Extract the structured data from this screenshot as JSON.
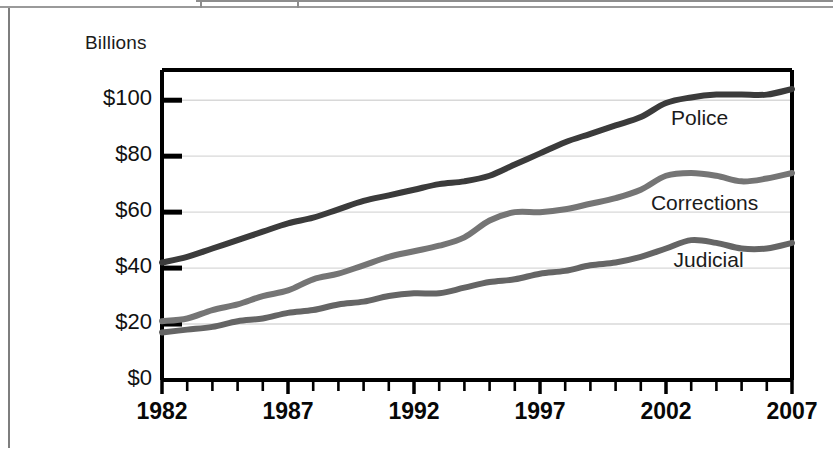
{
  "chart_data": {
    "type": "line",
    "title": "",
    "subtitle": "",
    "unit_label": "Billions",
    "xlabel": "",
    "ylabel": "",
    "xlim": [
      1982,
      2007
    ],
    "ylim": [
      0,
      110
    ],
    "axis_max_gridline": 100,
    "grid": true,
    "grid_orientation": "horizontal",
    "legend_position": "inline-right",
    "x": [
      1982,
      1983,
      1984,
      1985,
      1986,
      1987,
      1988,
      1989,
      1990,
      1991,
      1992,
      1993,
      1994,
      1995,
      1996,
      1997,
      1998,
      1999,
      2000,
      2001,
      2002,
      2003,
      2004,
      2005,
      2006,
      2007
    ],
    "xticks": [
      1982,
      1987,
      1992,
      1997,
      2002,
      2007
    ],
    "xtick_labels": [
      "1982",
      "1987",
      "1992",
      "1997",
      "2002",
      "2007"
    ],
    "xticks_minor_every": 1,
    "yticks": [
      0,
      20,
      40,
      60,
      80,
      100
    ],
    "ytick_labels": [
      "$0",
      "$20",
      "$40",
      "$60",
      "$80",
      "$100"
    ],
    "series": [
      {
        "name": "Police",
        "color": "#3b3b3b",
        "label": "Police",
        "label_x": 2002.2,
        "label_y": 93.0,
        "values": [
          42,
          44,
          47,
          50,
          53,
          56,
          58,
          61,
          64,
          66,
          68,
          70,
          71,
          73,
          77,
          81,
          85,
          88,
          91,
          94,
          99,
          101,
          102,
          102,
          102,
          104
        ]
      },
      {
        "name": "Corrections",
        "color": "#757575",
        "label": "Corrections",
        "label_x": 2001.4,
        "label_y": 62.5,
        "values": [
          21,
          22,
          25,
          27,
          30,
          32,
          36,
          38,
          41,
          44,
          46,
          48,
          51,
          57,
          60,
          60,
          61,
          63,
          65,
          68,
          73,
          74,
          73,
          71,
          72,
          74
        ]
      },
      {
        "name": "Judicial",
        "color": "#656565",
        "label": "Judicial",
        "label_x": 2002.3,
        "label_y": 42.0,
        "values": [
          17,
          18,
          19,
          21,
          22,
          24,
          25,
          27,
          28,
          30,
          31,
          31,
          33,
          35,
          36,
          38,
          39,
          41,
          42,
          44,
          47,
          50,
          49,
          47,
          47,
          49
        ]
      }
    ]
  },
  "plot_geometry": {
    "left": 162,
    "right": 792,
    "top": 70,
    "bottom": 380,
    "y_value_at_top": 110.8,
    "y_value_at_bottom": 0
  }
}
